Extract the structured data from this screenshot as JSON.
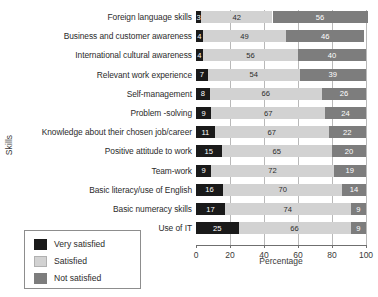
{
  "chart_data": {
    "type": "bar",
    "orientation": "horizontal",
    "stacked": true,
    "title": "",
    "xlabel": "Percentage",
    "ylabel": "Skills",
    "xlim": [
      0,
      100
    ],
    "xticks": [
      0,
      20,
      40,
      60,
      80,
      100
    ],
    "grid": true,
    "grid_axis": "x",
    "legend_position": "bottom-left",
    "categories": [
      "Foreign language skills",
      "Business and customer awareness",
      "International cultural awareness",
      "Relevant work experience",
      "Self-management",
      "Problem -solving",
      "Knowledge about their chosen job/career",
      "Positive attitude to work",
      "Team-work",
      "Basic literacy/use of English",
      "Basic numeracy skills",
      "Use of IT"
    ],
    "series": [
      {
        "name": "Very satisfied",
        "color": "#1a1a1a",
        "values": [
          3,
          4,
          4,
          7,
          8,
          9,
          11,
          15,
          9,
          16,
          17,
          25
        ]
      },
      {
        "name": "Satisfied",
        "color": "#d2d2d2",
        "values": [
          42,
          49,
          56,
          54,
          66,
          67,
          67,
          65,
          72,
          70,
          74,
          66
        ]
      },
      {
        "name": "Not satisfied",
        "color": "#7d7d7d",
        "values": [
          56,
          46,
          40,
          39,
          26,
          24,
          22,
          20,
          19,
          14,
          9,
          9
        ]
      }
    ]
  },
  "legend": {
    "items": [
      {
        "label": "Very satisfied"
      },
      {
        "label": "Satisfied"
      },
      {
        "label": "Not satisfied"
      }
    ]
  }
}
